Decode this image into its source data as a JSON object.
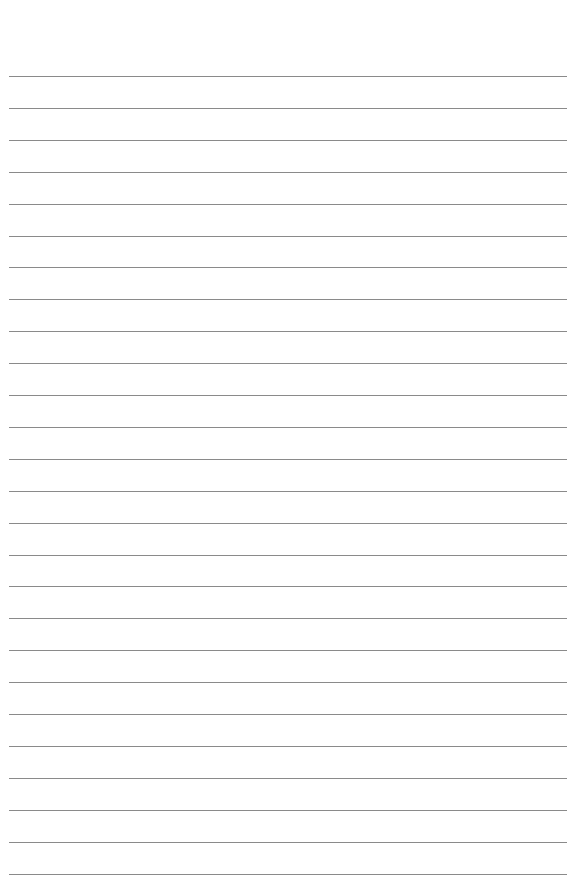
{
  "page": {
    "type": "lined-paper",
    "background": "#ffffff",
    "line_color": "#8a8a8a",
    "line_count": 26,
    "first_line_y": 76,
    "line_spacing": 31.9,
    "line_left": 9,
    "line_width": 558
  }
}
